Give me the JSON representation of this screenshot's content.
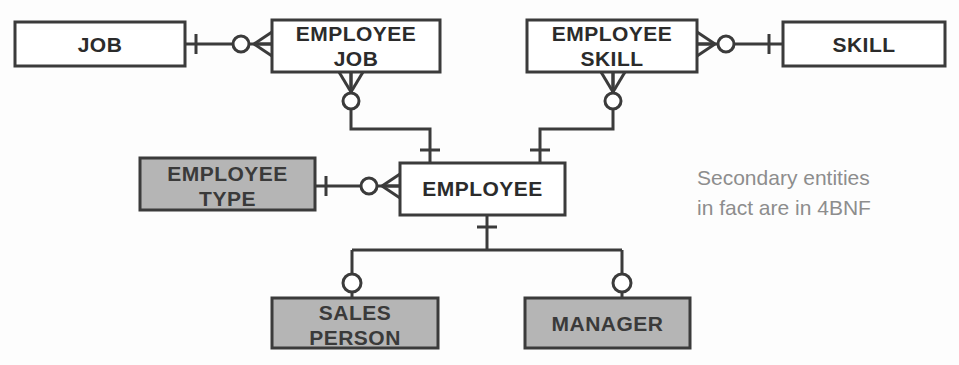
{
  "diagram": {
    "type": "entity-relationship-diagram",
    "notation": "crow's foot",
    "background_color": "#fdfdfd",
    "line_color": "#3b3b3b",
    "primary_entity_fill": "#ffffff",
    "secondary_entity_fill": "#b5b5b5",
    "annotation_color": "#8d8d8d",
    "entities": [
      {
        "id": "job",
        "label": "JOB",
        "kind": "primary",
        "fill": "#ffffff",
        "x": 15,
        "y": 22,
        "width": 170,
        "height": 44
      },
      {
        "id": "employee_job",
        "label": "EMPLOYEE\nJOB",
        "kind": "primary",
        "fill": "#ffffff",
        "x": 272,
        "y": 20,
        "width": 168,
        "height": 52
      },
      {
        "id": "employee_skill",
        "label": "EMPLOYEE\nSKILL",
        "kind": "primary",
        "fill": "#ffffff",
        "x": 527,
        "y": 20,
        "width": 170,
        "height": 52
      },
      {
        "id": "skill",
        "label": "SKILL",
        "kind": "primary",
        "fill": "#ffffff",
        "x": 783,
        "y": 22,
        "width": 162,
        "height": 44
      },
      {
        "id": "employee_type",
        "label": "EMPLOYEE\nTYPE",
        "kind": "secondary",
        "fill": "#b5b5b5",
        "x": 140,
        "y": 158,
        "width": 175,
        "height": 52
      },
      {
        "id": "employee",
        "label": "EMPLOYEE",
        "kind": "primary",
        "fill": "#ffffff",
        "x": 400,
        "y": 163,
        "width": 165,
        "height": 52
      },
      {
        "id": "sales_person",
        "label": "SALES\nPERSON",
        "kind": "secondary",
        "fill": "#b5b5b5",
        "x": 272,
        "y": 298,
        "width": 166,
        "height": 50
      },
      {
        "id": "manager",
        "label": "MANAGER",
        "kind": "secondary",
        "fill": "#b5b5b5",
        "x": 525,
        "y": 298,
        "width": 165,
        "height": 50
      }
    ],
    "relationships": [
      {
        "id": "job-employee-job",
        "from": "job",
        "to": "employee_job",
        "from_cardinality": "one-mandatory",
        "to_cardinality": "zero-or-many"
      },
      {
        "id": "employee-job-employee",
        "from": "employee_job",
        "to": "employee",
        "from_cardinality": "zero-or-many",
        "to_cardinality": "one-mandatory"
      },
      {
        "id": "employee-skill-skill",
        "from": "employee_skill",
        "to": "skill",
        "from_cardinality": "zero-or-many",
        "to_cardinality": "one-mandatory"
      },
      {
        "id": "employee-skill-employee",
        "from": "employee_skill",
        "to": "employee",
        "from_cardinality": "zero-or-many",
        "to_cardinality": "one-mandatory"
      },
      {
        "id": "employee-type-employee",
        "from": "employee_type",
        "to": "employee",
        "from_cardinality": "one-mandatory",
        "to_cardinality": "zero-or-many"
      },
      {
        "id": "employee-sales-person",
        "from": "employee",
        "to": "sales_person",
        "from_cardinality": "one-mandatory",
        "to_cardinality": "zero-or-one"
      },
      {
        "id": "employee-manager",
        "from": "employee",
        "to": "manager",
        "from_cardinality": "one-mandatory",
        "to_cardinality": "zero-or-one"
      }
    ],
    "annotation": {
      "text": "Secondary entities\nin fact are in 4BNF",
      "x": 697,
      "y": 163
    }
  }
}
